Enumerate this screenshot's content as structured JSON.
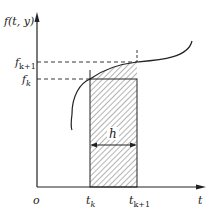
{
  "diagram": {
    "y_axis_label": "f(t, y)",
    "x_axis_label": "t",
    "origin_label": "o",
    "y_ticks": [
      {
        "label_base": "f",
        "label_sub": "k+1"
      },
      {
        "label_base": "f",
        "label_sub": "k"
      }
    ],
    "x_ticks": [
      {
        "label_base": "t",
        "label_sub": "k"
      },
      {
        "label_base": "t",
        "label_sub": "k+1"
      }
    ],
    "step_label": "h",
    "colors": {
      "line": "#222222",
      "hatch": "#444444",
      "background": "#ffffff"
    }
  }
}
